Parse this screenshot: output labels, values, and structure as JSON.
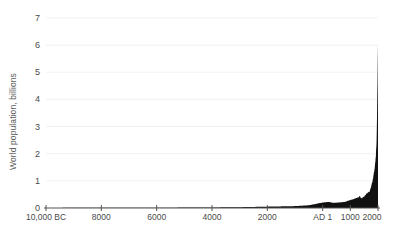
{
  "chart_data": {
    "type": "area",
    "title": "",
    "subtitle": "",
    "xlabel": "",
    "ylabel": "World population, billions",
    "xlim": [
      -10000,
      2000
    ],
    "ylim": [
      0,
      7
    ],
    "grid": true,
    "legend": null,
    "y_ticks": [
      0,
      1,
      2,
      3,
      4,
      5,
      6,
      7
    ],
    "y_tick_labels": [
      "0",
      "1",
      "2",
      "3",
      "4",
      "5",
      "6",
      "7"
    ],
    "x_ticks": [
      -10000,
      -8000,
      -6000,
      -4000,
      -2000,
      1,
      1000,
      2000
    ],
    "x_tick_labels": [
      "10,000 BC",
      "8000",
      "6000",
      "4000",
      "2000",
      "AD 1",
      "1000",
      "2000"
    ],
    "series_name": "World population",
    "x": [
      -10000,
      -9000,
      -8000,
      -7000,
      -6000,
      -5000,
      -4000,
      -3000,
      -2000,
      -1000,
      -500,
      1,
      200,
      400,
      600,
      800,
      1000,
      1100,
      1200,
      1300,
      1340,
      1400,
      1500,
      1600,
      1700,
      1750,
      1800,
      1850,
      1900,
      1920,
      1940,
      1950,
      1960,
      1970,
      1980,
      1990,
      2000,
      2010
    ],
    "values": [
      0.004,
      0.005,
      0.005,
      0.007,
      0.01,
      0.015,
      0.02,
      0.03,
      0.05,
      0.07,
      0.1,
      0.2,
      0.223,
      0.19,
      0.206,
      0.224,
      0.295,
      0.32,
      0.36,
      0.4,
      0.443,
      0.35,
      0.425,
      0.545,
      0.61,
      0.79,
      0.98,
      1.26,
      1.65,
      1.86,
      2.3,
      2.53,
      3.03,
      3.7,
      4.44,
      5.32,
      6.14,
      6.9
    ],
    "colors": {
      "area_fill": "#111111",
      "axis": "#555555",
      "grid": "#f2f2f2",
      "tick_text": "#4a4a4a",
      "axis_title": "#5a5a5a",
      "background": "#ffffff"
    },
    "annotations": []
  }
}
